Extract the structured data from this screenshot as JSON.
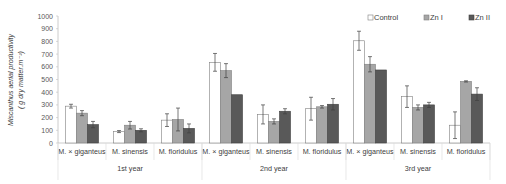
{
  "chart_data": {
    "type": "bar",
    "title": "",
    "ylabel": "Miscanthus aerial productivity",
    "ylabel_unit": "( g dry matter.m⁻²)",
    "xlabel": "",
    "ylim": [
      0,
      1000
    ],
    "yticks": [
      0,
      100,
      200,
      300,
      400,
      500,
      600,
      700,
      800,
      900,
      1000
    ],
    "grid": false,
    "legend_position": "top-right",
    "groups": [
      "1st year",
      "2nd year",
      "3rd year"
    ],
    "categories": [
      "M. × giganteus",
      "M. sinensis",
      "M. floridulus",
      "M. × giganteus",
      "M. sinensis",
      "M. floridulus",
      "M. × giganteus",
      "M. sinensis",
      "M. floridulus"
    ],
    "series": [
      {
        "name": "Control",
        "color": "#ffffff",
        "values": [
          290,
          90,
          180,
          635,
          225,
          270,
          805,
          365,
          140
        ],
        "errors": [
          15,
          8,
          50,
          70,
          75,
          90,
          75,
          85,
          105
        ]
      },
      {
        "name": "Zn I",
        "color": "#a6a6a6",
        "values": [
          235,
          140,
          185,
          570,
          170,
          285,
          620,
          280,
          485
        ],
        "errors": [
          20,
          30,
          90,
          55,
          20,
          10,
          60,
          20,
          5
        ]
      },
      {
        "name": "Zn II",
        "color": "#595959",
        "values": [
          145,
          100,
          115,
          380,
          250,
          305,
          575,
          300,
          385
        ],
        "errors": [
          25,
          12,
          35,
          0,
          20,
          45,
          0,
          20,
          50
        ]
      }
    ]
  }
}
